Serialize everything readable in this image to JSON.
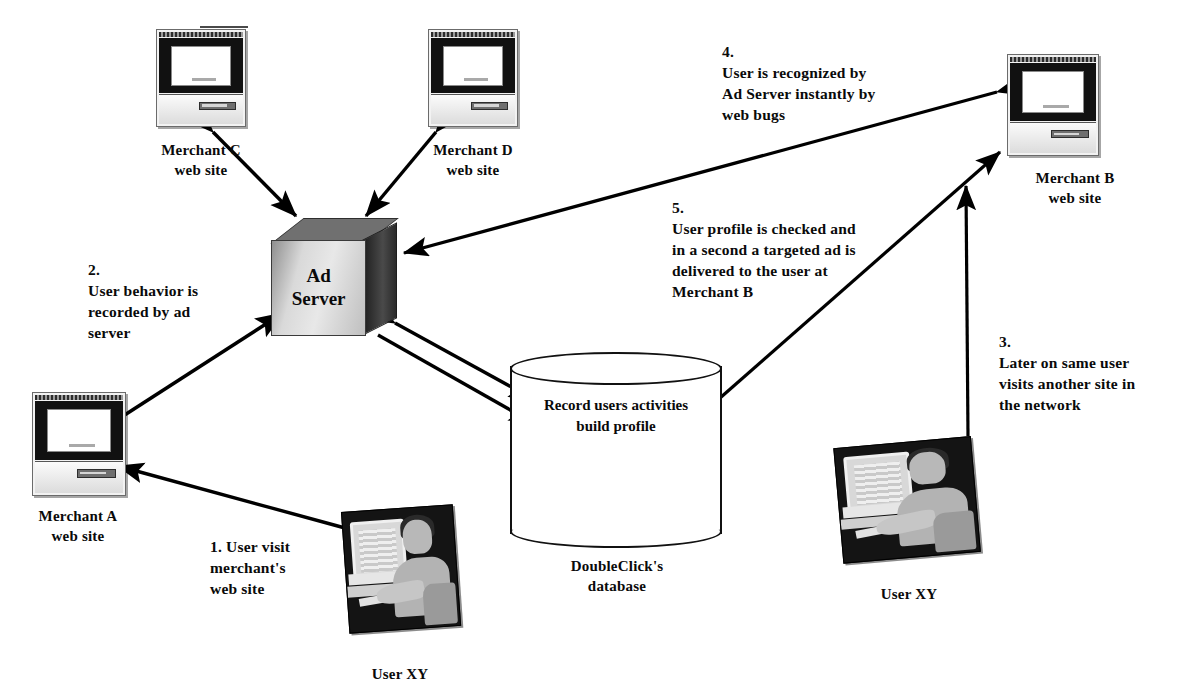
{
  "diagram": {
    "nodes": {
      "merchant_c": {
        "label": "Merchant C\nweb site",
        "icon": "desktop-computer-icon"
      },
      "merchant_d": {
        "label": "Merchant D\nweb site",
        "icon": "desktop-computer-icon"
      },
      "merchant_b": {
        "label": "Merchant B\nweb site",
        "icon": "desktop-computer-icon"
      },
      "merchant_a": {
        "label": "Merchant A\nweb site",
        "icon": "desktop-computer-icon"
      },
      "ad_server": {
        "label": "Ad\nServer",
        "icon": "server-cube-icon"
      },
      "database": {
        "label": "Record users activities\nbuild profile",
        "caption": "DoubleClick's\ndatabase",
        "icon": "database-cylinder-icon"
      },
      "user_left": {
        "label": "User XY",
        "icon": "user-at-computer-photo"
      },
      "user_right": {
        "label": "User XY",
        "icon": "user-at-computer-photo"
      }
    },
    "steps": [
      {
        "number": "1.",
        "text": "1. User visit\nmerchant's\nweb site"
      },
      {
        "number": "2.",
        "text": "2.\nUser behavior is\nrecorded by ad\nserver"
      },
      {
        "number": "3.",
        "text": "3.\nLater on same user\nvisits another site in\nthe network"
      },
      {
        "number": "4.",
        "text": "4.\nUser is recognized by\nAd Server instantly by\nweb bugs"
      },
      {
        "number": "5.",
        "text": "5.\nUser profile is checked and\nin a second a targeted ad is\ndelivered to the user at\nMerchant B"
      }
    ],
    "colors": {
      "ink": "#0a0a0a",
      "arrow": "#000000",
      "paper": "#ffffff",
      "cube_front": "#e8e8e8",
      "cube_top": "#707070",
      "cube_side": "#2a2a2a"
    }
  }
}
